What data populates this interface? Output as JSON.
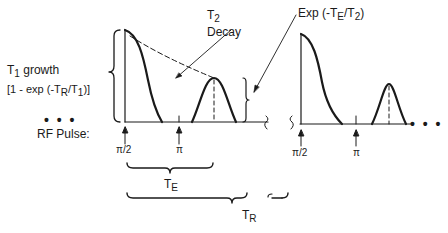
{
  "labels": {
    "t2_decay": {
      "main": "T",
      "sub": "2",
      "line2": "Decay"
    },
    "exp_te_t2": {
      "prefix": "Exp (-T",
      "sub1": "E",
      "mid": "/T",
      "sub2": "2",
      "suffix": ")"
    },
    "t1_growth": {
      "main": "T",
      "sub": "1",
      "rest": " growth"
    },
    "t1_formula": {
      "prefix": "[1 - exp (-T",
      "sub1": "R",
      "mid": "/T",
      "sub2": "1",
      "suffix": ")]"
    },
    "rf_pulse": "RF Pulse:",
    "ellipsis": "• • •",
    "pulse_90_first": "π/2",
    "pulse_180_first": "π",
    "pulse_90_second": "π/2",
    "pulse_180_second": "π",
    "te": {
      "main": "T",
      "sub": "E"
    },
    "tr": {
      "main": "T",
      "sub": "R"
    }
  },
  "colors": {
    "ink": "#1a1a1a",
    "background": "#ffffff"
  }
}
